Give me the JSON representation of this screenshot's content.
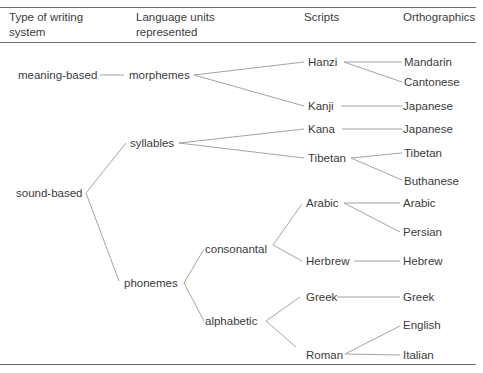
{
  "header": {
    "col1_line1": "Type of writing",
    "col1_line2": "system",
    "col2_line1": "Language units",
    "col2_line2": "represented",
    "col3": "Scripts",
    "col4": "Orthographics"
  },
  "types": {
    "meaning": "meaning-based",
    "sound": "sound-based"
  },
  "units": {
    "morphemes": "morphemes",
    "syllables": "syllables",
    "phonemes": "phonemes",
    "consonantal": "consonantal",
    "alphabetic": "alphabetic"
  },
  "scripts": {
    "hanzi": "Hanzi",
    "kanji": "Kanji",
    "kana": "Kana",
    "tibetan": "Tibetan",
    "arabic": "Arabic",
    "herbrew": "Herbrew",
    "greek": "Greek",
    "roman": "Roman"
  },
  "orthographics": {
    "mandarin": "Mandarin",
    "cantonese": "Cantonese",
    "japanese_kanji": "Japanese",
    "japanese_kana": "Japanese",
    "tibetan": "Tibetan",
    "buthanese": "Buthanese",
    "arabic": "Arabic",
    "persian": "Persian",
    "hebrew": "Hebrew",
    "greek": "Greek",
    "english": "English",
    "italian": "Italian"
  }
}
